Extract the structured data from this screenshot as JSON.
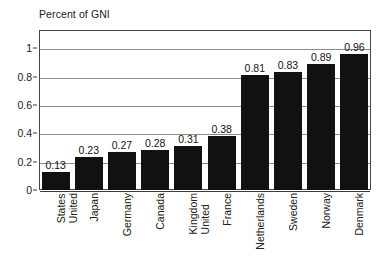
{
  "chart_data": {
    "type": "bar",
    "title": "Percent of GNI",
    "xlabel": "",
    "ylabel": "",
    "ylim": [
      0,
      1.13
    ],
    "yticks": [
      "0",
      "0.2",
      "0.4",
      "0.6",
      "0.8",
      "1"
    ],
    "ytick_values": [
      0,
      0.2,
      0.4,
      0.6,
      0.8,
      1
    ],
    "grid": true,
    "legend": "none",
    "categories": [
      "United States",
      "Japan",
      "Germany",
      "Canada",
      "United Kingdom",
      "France",
      "Netherlands",
      "Sweden",
      "Norway",
      "Denmark"
    ],
    "category_lines": [
      [
        "United",
        "States"
      ],
      [
        "Japan"
      ],
      [
        "Germany"
      ],
      [
        "Canada"
      ],
      [
        "United",
        "Kingdom"
      ],
      [
        "France"
      ],
      [
        "Netherlands"
      ],
      [
        "Sweden"
      ],
      [
        "Norway"
      ],
      [
        "Denmark"
      ]
    ],
    "values": [
      0.13,
      0.23,
      0.27,
      0.28,
      0.31,
      0.38,
      0.81,
      0.83,
      0.89,
      0.96
    ],
    "data_labels": [
      "0.13",
      "0.23",
      "0.27",
      "0.28",
      "0.31",
      "0.38",
      "0.81",
      "0.83",
      "0.89",
      "0.96"
    ],
    "bar_color": "#111111",
    "grid_color": "#8c8c8c",
    "frame_color": "#444444",
    "text_color": "#202020"
  }
}
